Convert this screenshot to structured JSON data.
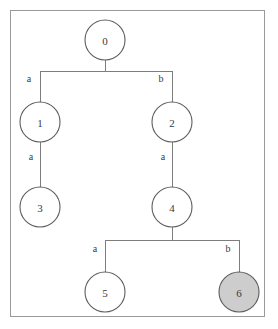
{
  "diagram": {
    "background_color": "#ffffff",
    "frame_color": "#9a9a9a",
    "edge_color": "#7d7d7d",
    "node_outline_color": "#5d5d5d",
    "node_fill_plain": "#ffffff",
    "node_fill_highlight": "#cdcdcd",
    "text_color": "#3a3a3a",
    "nodes": [
      {
        "id": "n0",
        "label": "0",
        "cx": 105,
        "cy": 40,
        "r": 20,
        "highlighted": false
      },
      {
        "id": "n1",
        "label": "1",
        "cx": 40,
        "cy": 122,
        "r": 20,
        "highlighted": false
      },
      {
        "id": "n2",
        "label": "2",
        "cx": 172,
        "cy": 122,
        "r": 20,
        "highlighted": false
      },
      {
        "id": "n3",
        "label": "3",
        "cx": 40,
        "cy": 207,
        "r": 20,
        "highlighted": false
      },
      {
        "id": "n4",
        "label": "4",
        "cx": 172,
        "cy": 207,
        "r": 20,
        "highlighted": false
      },
      {
        "id": "n5",
        "label": "5",
        "cx": 105,
        "cy": 292,
        "r": 20,
        "highlighted": false
      },
      {
        "id": "n6",
        "label": "6",
        "cx": 239,
        "cy": 292,
        "r": 20,
        "highlighted": true
      }
    ],
    "edges": [
      {
        "id": "e0-1",
        "from": "n0",
        "to": "n1",
        "label": "a",
        "label_x": 29,
        "label_y": 78
      },
      {
        "id": "e0-2",
        "from": "n0",
        "to": "n2",
        "label": "b",
        "label_x": 161,
        "label_y": 78
      },
      {
        "id": "e1-3",
        "from": "n1",
        "to": "n3",
        "label": "a",
        "label_x": 31,
        "label_y": 156
      },
      {
        "id": "e2-4",
        "from": "n2",
        "to": "n4",
        "label": "a",
        "label_x": 163,
        "label_y": 156
      },
      {
        "id": "e4-5",
        "from": "n4",
        "to": "n5",
        "label": "a",
        "label_x": 95,
        "label_y": 248
      },
      {
        "id": "e4-6",
        "from": "n4",
        "to": "n6",
        "label": "b",
        "label_x": 228,
        "label_y": 248
      }
    ],
    "connectors": [
      {
        "id": "c-root-stem",
        "x1": 105,
        "y1": 60,
        "x2": 105,
        "y2": 71
      },
      {
        "id": "c-root-bar",
        "x1": 40,
        "y1": 71,
        "x2": 172,
        "y2": 71
      },
      {
        "id": "c-left-drop",
        "x1": 40,
        "y1": 71,
        "x2": 40,
        "y2": 102
      },
      {
        "id": "c-right-drop",
        "x1": 172,
        "y1": 71,
        "x2": 172,
        "y2": 102
      },
      {
        "id": "c-n1-n3",
        "x1": 40,
        "y1": 142,
        "x2": 40,
        "y2": 187
      },
      {
        "id": "c-n2-n4",
        "x1": 172,
        "y1": 142,
        "x2": 172,
        "y2": 187
      },
      {
        "id": "c-n4-stem",
        "x1": 172,
        "y1": 227,
        "x2": 172,
        "y2": 240
      },
      {
        "id": "c-lower-bar",
        "x1": 105,
        "y1": 240,
        "x2": 239,
        "y2": 240
      },
      {
        "id": "c-n5-drop",
        "x1": 105,
        "y1": 240,
        "x2": 105,
        "y2": 272
      },
      {
        "id": "c-n6-drop",
        "x1": 239,
        "y1": 240,
        "x2": 239,
        "y2": 272
      }
    ]
  },
  "chart_data": {
    "type": "diagram",
    "subtype": "tree",
    "node_ids": [
      "0",
      "1",
      "2",
      "3",
      "4",
      "5",
      "6"
    ],
    "highlighted_nodes": [
      "6"
    ],
    "edge_list": [
      {
        "source": "0",
        "target": "1",
        "label": "a"
      },
      {
        "source": "0",
        "target": "2",
        "label": "b"
      },
      {
        "source": "1",
        "target": "3",
        "label": "a"
      },
      {
        "source": "2",
        "target": "4",
        "label": "a"
      },
      {
        "source": "4",
        "target": "5",
        "label": "a"
      },
      {
        "source": "4",
        "target": "6",
        "label": "b"
      }
    ],
    "edge_alphabet": [
      "a",
      "b"
    ],
    "depth_levels": [
      {
        "level": 0,
        "nodes": [
          "0"
        ]
      },
      {
        "level": 1,
        "nodes": [
          "1",
          "2"
        ]
      },
      {
        "level": 2,
        "nodes": [
          "3",
          "4"
        ]
      },
      {
        "level": 3,
        "nodes": [
          "5",
          "6"
        ]
      }
    ]
  }
}
